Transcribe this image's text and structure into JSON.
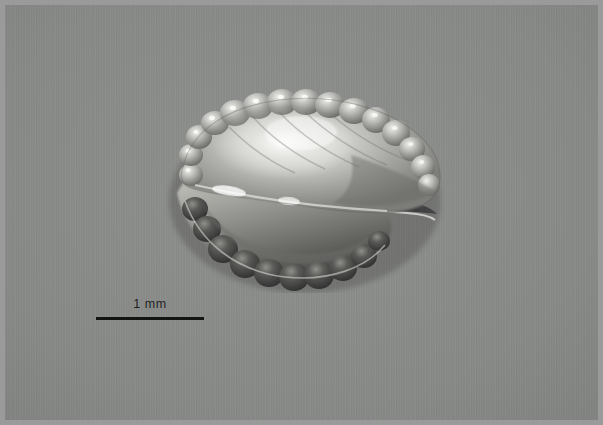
{
  "figure": {
    "type": "macrophotograph",
    "background_color": "#888a88",
    "frame_color": "#9a9a9a",
    "width_px": 603,
    "height_px": 425
  },
  "scale_bar": {
    "label": "1 mm",
    "value": 1,
    "unit": "mm",
    "line_color": "#141414",
    "line_length_px": 108,
    "line_thickness_px": 3,
    "position": "bottom-left"
  },
  "specimen": {
    "name": "specimen-body",
    "outline_color": "#4d4d4d",
    "body_light_tone": "#d8d8d4",
    "body_mid_tone": "#9b9b97",
    "body_dark_tone": "#4a4a48",
    "highlight_tone": "#f2f2ee",
    "regions": [
      {
        "name": "upper-lobe",
        "description": "large translucent upper valve with crenulate margin and bright central highlight"
      },
      {
        "name": "lower-lobe",
        "description": "darker lower valve with rounded marginal lobes"
      },
      {
        "name": "median-cleft",
        "description": "dark slit separating the two valves, opening toward the right"
      },
      {
        "name": "marginal-lobes",
        "description": "series of rounded bead-like marginal lobes around the perimeter"
      }
    ]
  }
}
